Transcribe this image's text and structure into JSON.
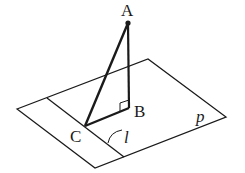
{
  "diagram": {
    "type": "geometry-3d",
    "plane_label": "p",
    "line_label": "l",
    "points": {
      "A": {
        "label": "A",
        "x": 128,
        "y": 23
      },
      "B": {
        "label": "B",
        "x": 129,
        "y": 108
      },
      "C": {
        "label": "C",
        "x": 85,
        "y": 126
      }
    },
    "segments": [
      "AB",
      "AC",
      "BC"
    ],
    "right_angle_at": "B",
    "colors": {
      "stroke": "#1a1a1a",
      "background": "#ffffff"
    }
  }
}
